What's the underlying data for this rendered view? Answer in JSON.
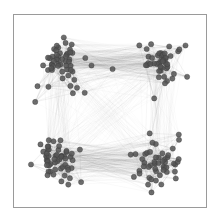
{
  "figure": {
    "width": 222,
    "height": 223,
    "frame": {
      "x": 13,
      "y": 14,
      "w": 194,
      "h": 194,
      "stroke": "#9a9a9a"
    },
    "background": "#ffffff"
  },
  "graph": {
    "type": "network",
    "node_color": "#555555",
    "node_stroke": "#3a3a3a",
    "node_radius": 2.6,
    "edge_color": "#6a6a6a",
    "clusters": [
      {
        "id": "top-left",
        "cx": 62,
        "cy": 64,
        "spread": 13,
        "count": 55
      },
      {
        "id": "top-right",
        "cx": 160,
        "cy": 62,
        "spread": 11,
        "count": 45
      },
      {
        "id": "bottom-left",
        "cx": 58,
        "cy": 160,
        "spread": 12,
        "count": 55
      },
      {
        "id": "bottom-right",
        "cx": 158,
        "cy": 163,
        "spread": 12,
        "count": 50
      }
    ],
    "bundles": [
      {
        "from": "top-left",
        "to": "top-right",
        "edges": 220,
        "opacity": 0.07
      },
      {
        "from": "bottom-left",
        "to": "bottom-right",
        "edges": 220,
        "opacity": 0.07
      },
      {
        "from": "top-left",
        "to": "bottom-left",
        "edges": 60,
        "opacity": 0.05
      },
      {
        "from": "top-right",
        "to": "bottom-right",
        "edges": 60,
        "opacity": 0.05
      },
      {
        "from": "top-left",
        "to": "bottom-right",
        "edges": 50,
        "opacity": 0.045
      },
      {
        "from": "top-right",
        "to": "bottom-left",
        "edges": 50,
        "opacity": 0.045
      }
    ],
    "seed": 7
  }
}
